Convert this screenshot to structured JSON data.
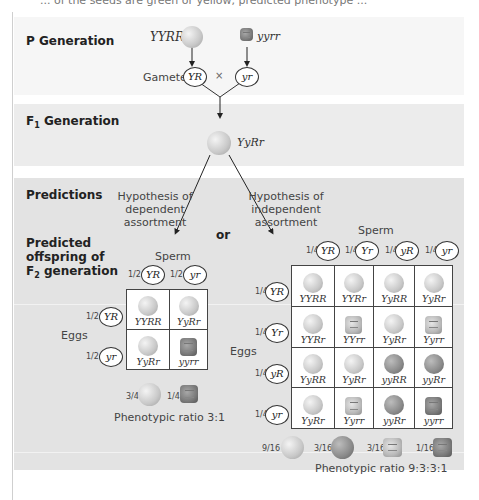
{
  "top_text_cut": "... of the seeds are green or yellow, predicted phenotype ...",
  "sections": {
    "p_generation": "P Generation",
    "f1_generation_prefix": "F",
    "f1_generation_sub": "1",
    "f1_generation_suffix": " Generation",
    "predictions": "Predictions",
    "predicted_offspring_line1": "Predicted",
    "predicted_offspring_line2": "offspring of",
    "predicted_offspring_line3_prefix": "F",
    "predicted_offspring_line3_sub": "2",
    "predicted_offspring_line3_suffix": " generation"
  },
  "p_gen": {
    "parent1": "YYRR",
    "parent2": "yyrr",
    "gametes_label": "Gametes",
    "gamete1": "YR",
    "gamete2": "yr",
    "cross": "×"
  },
  "f1": {
    "genotype": "YyRr"
  },
  "hypotheses": {
    "dependent_line1": "Hypothesis of",
    "dependent_line2": "dependent assortment",
    "independent_line1": "Hypothesis of",
    "independent_line2": "independent assortment",
    "or": "or"
  },
  "dependent": {
    "sperm_label": "Sperm",
    "eggs_label": "Eggs",
    "sperm": [
      {
        "frac": "1/2",
        "allele": "YR"
      },
      {
        "frac": "1/2",
        "allele": "yr"
      }
    ],
    "eggs": [
      {
        "frac": "1/2",
        "allele": "YR"
      },
      {
        "frac": "1/2",
        "allele": "yr"
      }
    ],
    "cells": [
      [
        "YYRR",
        "YyRr"
      ],
      [
        "YyRr",
        "yyrr"
      ]
    ],
    "phenotype_fracs": [
      "3/4",
      "1/4"
    ],
    "ratio": "Phenotypic ratio 3:1"
  },
  "independent": {
    "sperm_label": "Sperm",
    "eggs_label": "Eggs",
    "sperm": [
      {
        "frac": "1/4",
        "allele": "YR"
      },
      {
        "frac": "1/4",
        "allele": "Yr"
      },
      {
        "frac": "1/4",
        "allele": "yR"
      },
      {
        "frac": "1/4",
        "allele": "yr"
      }
    ],
    "eggs": [
      {
        "frac": "1/4",
        "allele": "YR"
      },
      {
        "frac": "1/4",
        "allele": "Yr"
      },
      {
        "frac": "1/4",
        "allele": "yR"
      },
      {
        "frac": "1/4",
        "allele": "yr"
      }
    ],
    "cells": [
      [
        "YYRR",
        "YYRr",
        "YyRR",
        "YyRr"
      ],
      [
        "YYRr",
        "YYrr",
        "YyRr",
        "Yyrr"
      ],
      [
        "YyRR",
        "YyRr",
        "yyRR",
        "yyRr"
      ],
      [
        "YyRr",
        "Yyrr",
        "yyRr",
        "yyrr"
      ]
    ],
    "phenotype_fracs": [
      "9/16",
      "3/16",
      "3/16",
      "1/16"
    ],
    "ratio": "Phenotypic ratio 9:3:3:1"
  },
  "colors": {
    "band_p": "#f6f6f6",
    "band_f1": "#ececec",
    "band_predictions": "#e3e3e3",
    "line": "#333333"
  }
}
